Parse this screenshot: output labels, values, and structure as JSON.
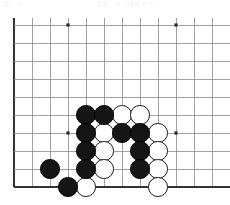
{
  "header": {
    "left_text": "図２４",
    "right_text": "黒番　白の味悪をつく"
  },
  "board": {
    "title": "go-board-diagram",
    "line_color": "#8a8a8a",
    "edge_color": "#333333",
    "background_color": "#ffffff",
    "black_color": "#151515",
    "white_color": "#ffffff",
    "cell_size": 18,
    "origin_x": 14,
    "origin_y": 11,
    "cols": 12,
    "rows": 10,
    "edges": {
      "left": true,
      "top": false,
      "right": false,
      "bottom": true
    },
    "star_points": [
      {
        "col": 3,
        "row": 0,
        "label": "star-point-upper-left"
      },
      {
        "col": 9,
        "row": 0,
        "label": "star-point-upper-right"
      },
      {
        "col": 3,
        "row": 6,
        "label": "star-point-lower-left"
      },
      {
        "col": 9,
        "row": 6,
        "label": "star-point-lower-right"
      }
    ],
    "stones": [
      {
        "id": "b1",
        "color": "black",
        "col": 4,
        "row": 5
      },
      {
        "id": "b2",
        "color": "black",
        "col": 5,
        "row": 5
      },
      {
        "id": "w1",
        "color": "white",
        "col": 6,
        "row": 5
      },
      {
        "id": "w2",
        "color": "white",
        "col": 7,
        "row": 5
      },
      {
        "id": "b3",
        "color": "black",
        "col": 4,
        "row": 6
      },
      {
        "id": "w3",
        "color": "white",
        "col": 5,
        "row": 6
      },
      {
        "id": "b4",
        "color": "black",
        "col": 6,
        "row": 6
      },
      {
        "id": "b5",
        "color": "black",
        "col": 7,
        "row": 6
      },
      {
        "id": "w4",
        "color": "white",
        "col": 8,
        "row": 6
      },
      {
        "id": "b6",
        "color": "black",
        "col": 4,
        "row": 7
      },
      {
        "id": "w5",
        "color": "white",
        "col": 5,
        "row": 7
      },
      {
        "id": "b7",
        "color": "black",
        "col": 7,
        "row": 7
      },
      {
        "id": "w6",
        "color": "white",
        "col": 8,
        "row": 7
      },
      {
        "id": "b8",
        "color": "black",
        "col": 2,
        "row": 8
      },
      {
        "id": "b9",
        "color": "black",
        "col": 4,
        "row": 8
      },
      {
        "id": "w7",
        "color": "white",
        "col": 5,
        "row": 8
      },
      {
        "id": "b10",
        "color": "black",
        "col": 7,
        "row": 8
      },
      {
        "id": "w8",
        "color": "white",
        "col": 8,
        "row": 8
      },
      {
        "id": "b11",
        "color": "black",
        "col": 3,
        "row": 9
      },
      {
        "id": "w9",
        "color": "white",
        "col": 4,
        "row": 9
      },
      {
        "id": "w10",
        "color": "white",
        "col": 8,
        "row": 9
      }
    ]
  }
}
